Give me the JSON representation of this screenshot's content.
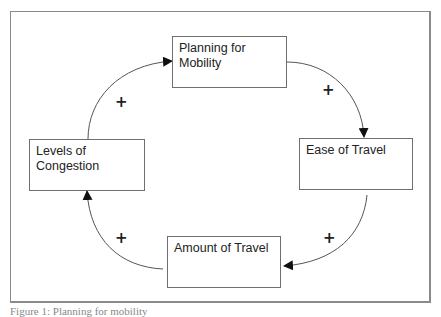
{
  "diagram": {
    "type": "causal-loop",
    "nodes": [
      {
        "id": "planning",
        "label": "Planning for\nMobility"
      },
      {
        "id": "ease",
        "label": "Ease of Travel"
      },
      {
        "id": "amount",
        "label": "Amount of Travel"
      },
      {
        "id": "congestion",
        "label": "Levels of\nCongestion"
      }
    ],
    "links": [
      {
        "from": "planning",
        "to": "ease",
        "polarity": "+"
      },
      {
        "from": "ease",
        "to": "amount",
        "polarity": "+"
      },
      {
        "from": "amount",
        "to": "congestion",
        "polarity": "+"
      },
      {
        "from": "congestion",
        "to": "planning",
        "polarity": "+"
      }
    ],
    "caption": "Figure 1: Planning for mobility"
  }
}
